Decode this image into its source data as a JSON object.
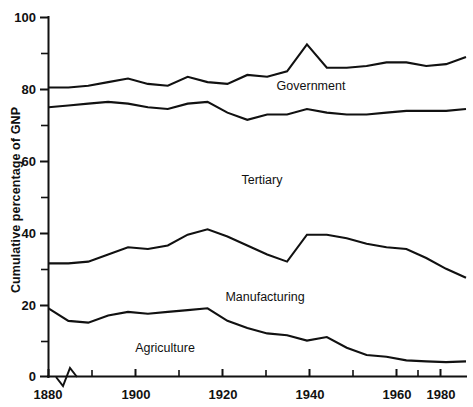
{
  "figure": {
    "background_color": "#ffffff",
    "line_color": "#111111"
  },
  "chart_data": {
    "type": "line",
    "title": "",
    "subtitle": "",
    "xlabel": "",
    "ylabel": "Cumulative percentage of GNP",
    "xlim": [
      1880,
      1985
    ],
    "ylim": [
      0,
      100
    ],
    "grid": false,
    "legend_position": "inline-annotations",
    "y_ticks_major": [
      0,
      20,
      40,
      60,
      80,
      100
    ],
    "y_ticks_major_labels": [
      "0",
      "20",
      "40",
      "60",
      "80",
      "100"
    ],
    "y_ticks_minor": [
      10,
      30,
      50,
      70,
      90
    ],
    "x_ticks_major": [
      1880,
      1900,
      1920,
      1940,
      1960,
      1980
    ],
    "x_ticks_major_labels": [
      "1880",
      "1900",
      "1920",
      "1940",
      "1960",
      "1980"
    ],
    "x_ticks_minor": [
      1890,
      1910,
      1930,
      1950,
      1970
    ],
    "axis_break_symbol": "zigzag-on-x-axis-after-1880",
    "annotations": [
      {
        "text": "Government",
        "x": 1945,
        "y": 84
      },
      {
        "text": "Tertiary",
        "x": 1920,
        "y": 51
      },
      {
        "text": "Manufacturing",
        "x": 1928,
        "y": 21
      },
      {
        "text": "Agriculture",
        "x": 1907,
        "y": 7
      }
    ],
    "x": [
      1880,
      1885,
      1890,
      1895,
      1900,
      1905,
      1910,
      1915,
      1920,
      1925,
      1930,
      1935,
      1940,
      1945,
      1950,
      1955,
      1960,
      1965,
      1970,
      1975,
      1980,
      1985
    ],
    "series": [
      {
        "name": "Agriculture",
        "note": "lower boundary line (cumulative top of Agriculture band)",
        "values": [
          19.0,
          15.5,
          15.0,
          17.0,
          18.0,
          17.5,
          18.0,
          18.5,
          19.0,
          15.5,
          13.5,
          12.0,
          11.5,
          10.0,
          11.0,
          8.0,
          6.0,
          5.5,
          4.5,
          4.2,
          4.0,
          4.2
        ]
      },
      {
        "name": "Manufacturing",
        "note": "cumulative top of Manufacturing band",
        "values": [
          31.5,
          31.5,
          32.0,
          34.0,
          36.0,
          35.5,
          36.5,
          39.5,
          41.0,
          39.0,
          36.5,
          34.0,
          32.0,
          39.5,
          39.5,
          38.5,
          37.0,
          36.0,
          35.5,
          33.0,
          30.0,
          27.5
        ]
      },
      {
        "name": "Tertiary",
        "note": "cumulative top of Tertiary band",
        "values": [
          75.0,
          75.5,
          76.0,
          76.5,
          76.0,
          75.0,
          74.5,
          76.0,
          76.5,
          73.5,
          71.5,
          73.0,
          73.0,
          74.5,
          73.5,
          73.0,
          73.0,
          73.5,
          74.0,
          74.0,
          74.0,
          74.5
        ]
      },
      {
        "name": "Government",
        "note": "cumulative top of Government band (total)",
        "values": [
          80.5,
          80.5,
          81.0,
          82.0,
          83.0,
          81.5,
          81.0,
          83.5,
          82.0,
          81.5,
          84.0,
          83.5,
          85.0,
          92.5,
          86.0,
          86.0,
          86.5,
          87.5,
          87.5,
          86.5,
          87.0,
          89.0
        ]
      }
    ]
  }
}
